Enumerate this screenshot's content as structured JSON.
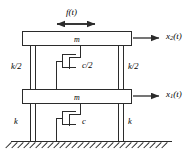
{
  "figure": {
    "stroke_color": "#2b2b2b",
    "background": "#ffffff"
  },
  "labels": {
    "force": "f(t)",
    "mass_top": "m",
    "mass_bottom": "m",
    "spring_upper_left": "k/2",
    "spring_upper_right": "k/2",
    "spring_lower_left": "k",
    "spring_lower_right": "k",
    "damper_upper": "c/2",
    "damper_lower": "c",
    "displacement_top_base": "x",
    "displacement_top_sub": "2",
    "displacement_top_arg": "(t)",
    "displacement_bottom_base": "x",
    "displacement_bottom_sub": "1",
    "displacement_bottom_arg": "(t)"
  },
  "icons": {
    "force_arrow": "double-headed-horizontal-arrow",
    "disp_arrow_top": "right-arrow",
    "disp_arrow_bottom": "right-arrow",
    "damper_upper_icon": "dashpot-symbol",
    "damper_lower_icon": "dashpot-symbol",
    "ground_icon": "hatched-ground"
  }
}
